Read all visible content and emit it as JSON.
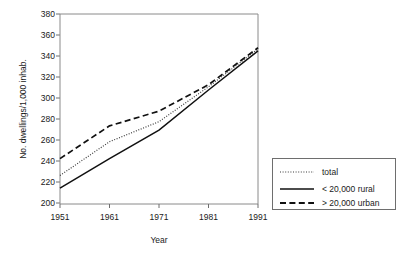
{
  "chart_data": {
    "type": "line",
    "title": "",
    "xlabel": "Year",
    "ylabel": "No. dwellings/1,000 inhab.",
    "x": [
      1951,
      1961,
      1971,
      1981,
      1991
    ],
    "xtick_labels": [
      "1951",
      "1961",
      "1971",
      "1981",
      "1991"
    ],
    "ytick_labels": [
      "200",
      "220",
      "240",
      "260",
      "280",
      "300",
      "320",
      "340",
      "360",
      "380"
    ],
    "yticks": [
      200,
      220,
      240,
      260,
      280,
      300,
      320,
      340,
      360,
      380
    ],
    "xlim": [
      1951,
      1991
    ],
    "ylim": [
      200,
      380
    ],
    "grid": false,
    "legend_position": "right-bottom-outside",
    "series": [
      {
        "name": "total",
        "style": "dotted",
        "color": "#3a3a3a",
        "values": [
          227,
          259,
          278,
          311,
          347
        ]
      },
      {
        "name": "< 20,000 rural",
        "style": "solid",
        "color": "#111111",
        "values": [
          215,
          243,
          270,
          308,
          345
        ]
      },
      {
        "name": "> 20,000 urban",
        "style": "dashed",
        "color": "#111111",
        "values": [
          243,
          274,
          288,
          313,
          348
        ]
      }
    ]
  },
  "axes": {
    "y_title": "No. dwellings/1,000 inhab.",
    "x_title": "Year"
  },
  "legend": {
    "items": [
      {
        "label": "total"
      },
      {
        "label": "< 20,000 rural"
      },
      {
        "label": "> 20,000 urban"
      }
    ]
  }
}
